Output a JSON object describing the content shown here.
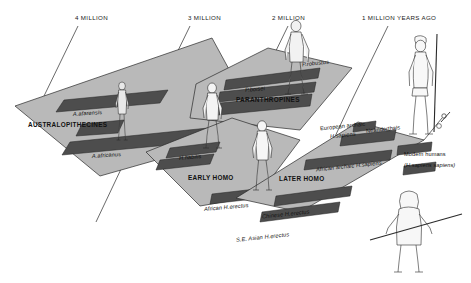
{
  "figure": {
    "title_axis": "time scale across top",
    "background_color": "#ffffff",
    "plane_fill": "#b0b0b0",
    "plane_fill_light": "#c4c4c4",
    "bar_fill": "#4a4a4a",
    "outline_color": "#1a1a1a"
  },
  "timeline": {
    "ticks": [
      {
        "label": "4 MILLION",
        "x": 75,
        "y": 16
      },
      {
        "label": "3 MILLION",
        "x": 188,
        "y": 16
      },
      {
        "label": "2 MILLION",
        "x": 272,
        "y": 16
      },
      {
        "label": "1 MILLION  YEARS AGO",
        "x": 362,
        "y": 16
      }
    ]
  },
  "planes": [
    {
      "name": "australopithecines",
      "group_label": "AUSTRALOPITHECINES"
    },
    {
      "name": "paranthropines",
      "group_label": "PARANTHROPINES"
    },
    {
      "name": "early-homo",
      "group_label": "EARLY HOMO"
    },
    {
      "name": "later-homo",
      "group_label": "LATER HOMO"
    }
  ],
  "labels": {
    "a_afarensis": "A.afarensis",
    "australopithecines": "AUSTRALOPITHECINES",
    "a_africanus": "A.africanus",
    "p_boisei": "P.boisei",
    "p_robustus": "P.robustus",
    "paranthropines": "PARANTHROPINES",
    "h_habilis": "H.habilis",
    "early_homo": "EARLY HOMO",
    "african_h_erectus": "African H.erectus",
    "later_homo": "LATER HOMO",
    "chinese_h_erectus": "Chinese H.erectus",
    "se_asian_h_erectus": "S.E. Asian H.erectus",
    "european_archaic": "European archaic",
    "european_archaic_2": "H.sapiens",
    "african_archaic": "African archaic H.sapiens",
    "neanderthals": "Neanderthals",
    "modern_humans": "Modern humans",
    "modern_humans_2": "(H.sapiens sapiens)"
  },
  "figures": [
    {
      "name": "australopithecine-figure",
      "desc": "small hairy bipedal hominid"
    },
    {
      "name": "paranthropine-figure",
      "desc": "robust hominid standing"
    },
    {
      "name": "early-homo-figure",
      "desc": "early homo standing"
    },
    {
      "name": "later-homo-figure",
      "desc": "later homo standing"
    },
    {
      "name": "modern-human-figure",
      "desc": "modern human with spear"
    },
    {
      "name": "neanderthal-figure",
      "desc": "clothed figure with horizontal spear"
    }
  ]
}
